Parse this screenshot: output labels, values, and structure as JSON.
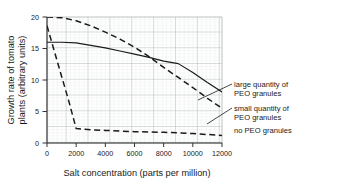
{
  "chart_data": {
    "type": "line",
    "title": "",
    "xlabel": "Salt concentration (parts per million)",
    "ylabel": "Growth rate of tomato plants (arbitrary units)",
    "ylabel_line1": "Growth rate of tomato",
    "ylabel_line2": "plants (arbitrary units)",
    "xlim": [
      0,
      12000
    ],
    "ylim": [
      0,
      20
    ],
    "xticks": [
      0,
      2000,
      4000,
      6000,
      8000,
      10000,
      12000
    ],
    "xtick_labels": [
      "0",
      "2000",
      "4000",
      "6000",
      "8000",
      "10000",
      "12000"
    ],
    "yticks": [
      0,
      5,
      10,
      15,
      20
    ],
    "ytick_labels": [
      "0",
      "5",
      "10",
      "15",
      "20"
    ],
    "grid": true,
    "grid_style": "graph-paper",
    "legend_position": "right-inline-leader-lines",
    "series": [
      {
        "name": "large quantity of PEO granules",
        "label_line1": "large quantity of",
        "label_line2": "PEO granules",
        "style": "solid",
        "color": "#1a1a1a",
        "x": [
          0,
          1000,
          2000,
          3000,
          4000,
          5000,
          6000,
          7000,
          8000,
          9000,
          10000,
          11000,
          12000
        ],
        "y": [
          16.0,
          16.0,
          15.9,
          15.5,
          15.1,
          14.6,
          14.1,
          13.6,
          13.0,
          12.6,
          11.2,
          9.6,
          8.1
        ]
      },
      {
        "name": "small quantity of PEO granules",
        "label_line1": "small quantity of",
        "label_line2": "PEO granules",
        "style": "dashed",
        "color": "#1a1a1a",
        "x": [
          0,
          1000,
          2000,
          3000,
          4000,
          5000,
          6000,
          7000,
          8000,
          9000,
          10000,
          11000,
          12000
        ],
        "y": [
          20.0,
          19.9,
          19.4,
          18.6,
          17.6,
          16.5,
          15.2,
          13.7,
          12.0,
          10.4,
          8.8,
          7.1,
          5.5
        ]
      },
      {
        "name": "no PEO granules",
        "label_line1": "no PEO granules",
        "label_line2": "",
        "style": "dashed",
        "color": "#1a1a1a",
        "x": [
          0,
          500,
          1000,
          1500,
          2000,
          3000,
          4000,
          5000,
          6000,
          7000,
          8000,
          9000,
          10000,
          11000,
          12000
        ],
        "y": [
          18.6,
          14.6,
          10.6,
          6.6,
          2.3,
          2.1,
          2.0,
          1.9,
          1.8,
          1.75,
          1.7,
          1.6,
          1.5,
          1.35,
          1.2
        ]
      }
    ],
    "colors": {
      "line": "#1a1a1a",
      "axis": "#333333",
      "grid_minor": "#cfd4d4",
      "grid_major": "#a9b0b0",
      "background": "#ffffff"
    }
  }
}
